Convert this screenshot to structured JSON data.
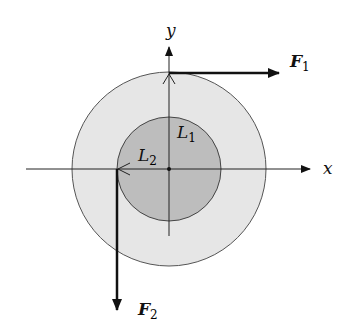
{
  "diagram": {
    "axes": {
      "x_label": "x",
      "y_label": "y"
    },
    "circles": {
      "outer": {
        "fill": "#e6e6e6",
        "stroke": "#555555"
      },
      "inner": {
        "fill": "#bdbdbd",
        "stroke": "#444444"
      }
    },
    "labels": {
      "L1": "L",
      "L1_sub": "1",
      "L2": "L",
      "L2_sub": "2"
    },
    "forces": {
      "F1": "F",
      "F1_sub": "1",
      "F1_direction": "right",
      "F2": "F",
      "F2_sub": "2",
      "F2_direction": "down"
    }
  }
}
